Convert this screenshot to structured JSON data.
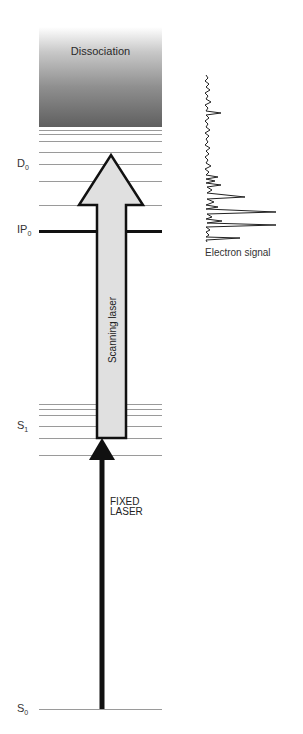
{
  "diagram": {
    "dissociation": {
      "label": "Dissociation"
    },
    "levels": {
      "D0": {
        "main": "D",
        "sub": "0"
      },
      "IP0": {
        "main": "IP",
        "sub": "0"
      },
      "S1": {
        "main": "S",
        "sub": "1"
      },
      "S0": {
        "main": "S",
        "sub": "0"
      }
    },
    "arrows": {
      "scanning": {
        "label": "Scanning laser"
      },
      "fixed": {
        "line1": "FIXED",
        "line2": "LASER"
      }
    },
    "spectrum": {
      "label": "Electron signal"
    },
    "colors": {
      "arrow_fill": "#e0e0e0",
      "outline": "#111111",
      "level_line": "#9a9a9a"
    }
  }
}
